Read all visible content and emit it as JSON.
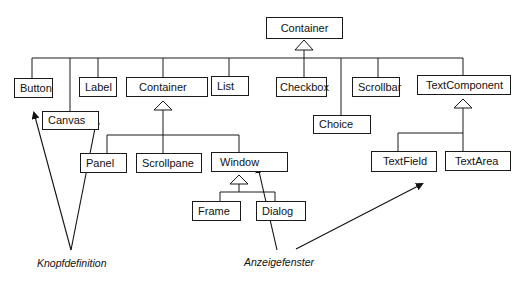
{
  "diagram": {
    "type": "class-hierarchy",
    "root": {
      "label": "Container"
    },
    "level1": [
      {
        "id": "button",
        "label": "Button"
      },
      {
        "id": "canvas",
        "label": "Canvas"
      },
      {
        "id": "label",
        "label": "Label"
      },
      {
        "id": "container",
        "label": "Container"
      },
      {
        "id": "list",
        "label": "List"
      },
      {
        "id": "checkbox",
        "label": "Checkbox"
      },
      {
        "id": "choice",
        "label": "Choice"
      },
      {
        "id": "scrollbar",
        "label": "Scrollbar"
      },
      {
        "id": "textcomponent",
        "label": "TextComponent"
      }
    ],
    "container_children": [
      {
        "id": "panel",
        "label": "Panel"
      },
      {
        "id": "scrollpane",
        "label": "Scrollpane"
      },
      {
        "id": "window",
        "label": "Window"
      }
    ],
    "window_children": [
      {
        "id": "frame",
        "label": "Frame"
      },
      {
        "id": "dialog",
        "label": "Dialog"
      }
    ],
    "textcomponent_children": [
      {
        "id": "textfield",
        "label": "TextField"
      },
      {
        "id": "textarea",
        "label": "TextArea"
      }
    ],
    "annotations": [
      {
        "id": "knopfdefinition",
        "label": "Knopfdefinition",
        "points_to": [
          "Button",
          "Label"
        ]
      },
      {
        "id": "anzeigefenster",
        "label": "Anzeigefenster",
        "points_to": [
          "Window",
          "TextField"
        ]
      }
    ]
  }
}
